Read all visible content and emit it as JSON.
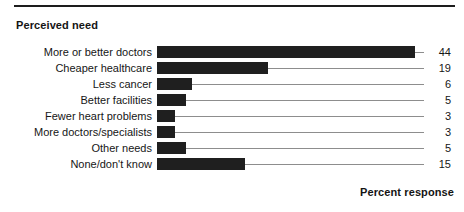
{
  "chart_data": {
    "type": "bar",
    "orientation": "horizontal",
    "title": "Perceived need",
    "xlabel": "Percent response",
    "ylabel": "",
    "categories": [
      "More or better doctors",
      "Cheaper healthcare",
      "Less cancer",
      "Better facilities",
      "Fewer heart problems",
      "More doctors/specialists",
      "Other needs",
      "None/don't know"
    ],
    "values": [
      44,
      19,
      6,
      5,
      3,
      3,
      5,
      15
    ],
    "value_labels": [
      "44",
      "19",
      "6",
      "5",
      "3",
      "3",
      "5",
      "15"
    ],
    "xlim": [
      0,
      45
    ],
    "grid": false,
    "legend": null,
    "bar_color": "#1f1f1f",
    "leader_line_color": "#8d8d8d",
    "rule_color": "#1d1d1d"
  }
}
